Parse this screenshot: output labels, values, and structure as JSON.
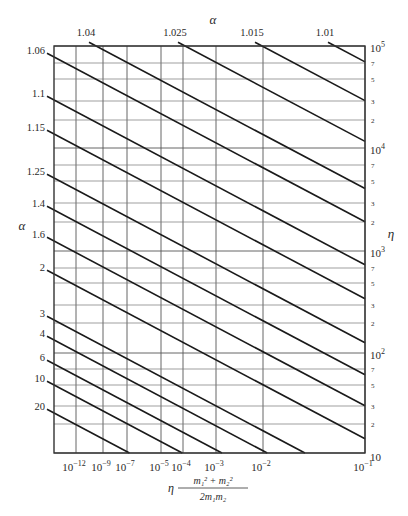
{
  "chart_data": {
    "type": "line",
    "title": "",
    "top_axis_label": "α",
    "left_axis_label": "α",
    "right_axis_label": "η",
    "xlabel": "η (m₁² + m₂²) / (2m₁m₂)",
    "xlabel_parts": {
      "prefix": "η",
      "numerator": "m₁² + m₂²",
      "denominator": "2m₁m₂"
    },
    "x_ticks": [
      {
        "label": "10",
        "exp": "−12",
        "x": 76
      },
      {
        "label": "10",
        "exp": "−9",
        "x": 103
      },
      {
        "label": "10",
        "exp": "−7",
        "x": 127
      },
      {
        "label": "10",
        "exp": "−5",
        "x": 161
      },
      {
        "label": "10",
        "exp": "−4",
        "x": 183
      },
      {
        "label": "10",
        "exp": "−3",
        "x": 216
      },
      {
        "label": "10",
        "exp": "−2",
        "x": 263
      },
      {
        "label": "10",
        "exp": "−1",
        "x": 365
      }
    ],
    "y_right_ticks": [
      {
        "label": "10",
        "exp": "5",
        "y": 46,
        "major": true
      },
      {
        "label": "7",
        "y": 63
      },
      {
        "label": "5",
        "y": 79
      },
      {
        "label": "3",
        "y": 101
      },
      {
        "label": "2",
        "y": 120
      },
      {
        "label": "10",
        "exp": "4",
        "y": 148,
        "major": true
      },
      {
        "label": "7",
        "y": 165
      },
      {
        "label": "5",
        "y": 181
      },
      {
        "label": "3",
        "y": 203
      },
      {
        "label": "2",
        "y": 222
      },
      {
        "label": "10",
        "exp": "3",
        "y": 251,
        "major": true
      },
      {
        "label": "7",
        "y": 268
      },
      {
        "label": "5",
        "y": 283
      },
      {
        "label": "3",
        "y": 305
      },
      {
        "label": "2",
        "y": 323
      },
      {
        "label": "10",
        "exp": "2",
        "y": 353,
        "major": true
      },
      {
        "label": "7",
        "y": 369
      },
      {
        "label": "5",
        "y": 385
      },
      {
        "label": "3",
        "y": 406
      },
      {
        "label": "2",
        "y": 424
      },
      {
        "label": "10",
        "exp": "",
        "y": 453,
        "major": true
      }
    ],
    "ylim_right": [
      10,
      100000
    ],
    "y_scale": "log",
    "grid": true,
    "series_top": [
      {
        "name": "1.04",
        "x_top": 96
      },
      {
        "name": "1.025",
        "x_top": 185
      },
      {
        "name": "1.015",
        "x_top": 262
      },
      {
        "name": "1.01",
        "x_top": 335
      }
    ],
    "series_left": [
      {
        "name": "1.06",
        "y_left": 57
      },
      {
        "name": "1.1",
        "y_left": 100
      },
      {
        "name": "1.15",
        "y_left": 134
      },
      {
        "name": "1.25",
        "y_left": 178
      },
      {
        "name": "1.4",
        "y_left": 210
      },
      {
        "name": "1.6",
        "y_left": 241
      },
      {
        "name": "2",
        "y_left": 274
      },
      {
        "name": "3",
        "y_left": 320
      },
      {
        "name": "4",
        "y_left": 340
      },
      {
        "name": "6",
        "y_left": 364
      },
      {
        "name": "10",
        "y_left": 385
      },
      {
        "name": "20",
        "y_left": 413
      }
    ],
    "plot_frame": {
      "left": 54,
      "top": 46,
      "right": 365,
      "bottom": 453
    },
    "line_slope": 0.53
  }
}
